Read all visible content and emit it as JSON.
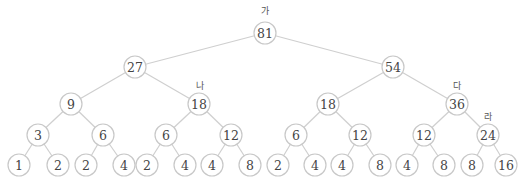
{
  "diagram": {
    "type": "binary-tree",
    "node_radius": 11,
    "colors": {
      "edge": "#cfcfcf",
      "node_stroke": "#c8c8c8",
      "node_fill": "#ffffff",
      "text": "#444444"
    },
    "nodes": [
      {
        "id": "n0",
        "value": "81",
        "x": 265,
        "y": 33
      },
      {
        "id": "n1",
        "value": "27",
        "x": 135,
        "y": 67
      },
      {
        "id": "n2",
        "value": "54",
        "x": 393,
        "y": 67
      },
      {
        "id": "n3",
        "value": "9",
        "x": 71,
        "y": 104
      },
      {
        "id": "n4",
        "value": "18",
        "x": 199,
        "y": 104
      },
      {
        "id": "n5",
        "value": "18",
        "x": 328,
        "y": 104
      },
      {
        "id": "n6",
        "value": "36",
        "x": 457,
        "y": 104
      },
      {
        "id": "n7",
        "value": "3",
        "x": 38,
        "y": 135
      },
      {
        "id": "n8",
        "value": "6",
        "x": 103,
        "y": 135
      },
      {
        "id": "n9",
        "value": "6",
        "x": 166,
        "y": 135
      },
      {
        "id": "n10",
        "value": "12",
        "x": 231,
        "y": 135
      },
      {
        "id": "n11",
        "value": "6",
        "x": 296,
        "y": 135
      },
      {
        "id": "n12",
        "value": "12",
        "x": 360,
        "y": 135
      },
      {
        "id": "n13",
        "value": "12",
        "x": 424,
        "y": 135
      },
      {
        "id": "n14",
        "value": "24",
        "x": 488,
        "y": 135
      },
      {
        "id": "n15",
        "value": "1",
        "x": 19,
        "y": 165
      },
      {
        "id": "n16",
        "value": "2",
        "x": 58,
        "y": 165
      },
      {
        "id": "n17",
        "value": "2",
        "x": 86,
        "y": 165
      },
      {
        "id": "n18",
        "value": "4",
        "x": 124,
        "y": 165
      },
      {
        "id": "n19",
        "value": "2",
        "x": 147,
        "y": 165
      },
      {
        "id": "n20",
        "value": "4",
        "x": 185,
        "y": 165
      },
      {
        "id": "n21",
        "value": "4",
        "x": 212,
        "y": 165
      },
      {
        "id": "n22",
        "value": "8",
        "x": 250,
        "y": 165
      },
      {
        "id": "n23",
        "value": "2",
        "x": 278,
        "y": 165
      },
      {
        "id": "n24",
        "value": "4",
        "x": 315,
        "y": 165
      },
      {
        "id": "n25",
        "value": "4",
        "x": 342,
        "y": 165
      },
      {
        "id": "n26",
        "value": "8",
        "x": 380,
        "y": 165
      },
      {
        "id": "n27",
        "value": "4",
        "x": 407,
        "y": 165
      },
      {
        "id": "n28",
        "value": "8",
        "x": 444,
        "y": 165
      },
      {
        "id": "n29",
        "value": "8",
        "x": 472,
        "y": 165
      },
      {
        "id": "n30",
        "value": "16",
        "x": 506,
        "y": 165
      }
    ],
    "edges": [
      [
        "n0",
        "n1"
      ],
      [
        "n0",
        "n2"
      ],
      [
        "n1",
        "n3"
      ],
      [
        "n1",
        "n4"
      ],
      [
        "n2",
        "n5"
      ],
      [
        "n2",
        "n6"
      ],
      [
        "n3",
        "n7"
      ],
      [
        "n3",
        "n8"
      ],
      [
        "n4",
        "n9"
      ],
      [
        "n4",
        "n10"
      ],
      [
        "n5",
        "n11"
      ],
      [
        "n5",
        "n12"
      ],
      [
        "n6",
        "n13"
      ],
      [
        "n6",
        "n14"
      ],
      [
        "n7",
        "n15"
      ],
      [
        "n7",
        "n16"
      ],
      [
        "n8",
        "n17"
      ],
      [
        "n8",
        "n18"
      ],
      [
        "n9",
        "n19"
      ],
      [
        "n9",
        "n20"
      ],
      [
        "n10",
        "n21"
      ],
      [
        "n10",
        "n22"
      ],
      [
        "n11",
        "n23"
      ],
      [
        "n11",
        "n24"
      ],
      [
        "n12",
        "n25"
      ],
      [
        "n12",
        "n26"
      ],
      [
        "n13",
        "n27"
      ],
      [
        "n13",
        "n28"
      ],
      [
        "n14",
        "n29"
      ],
      [
        "n14",
        "n30"
      ]
    ],
    "tags": [
      {
        "label": "가",
        "node": "n0",
        "x": 265,
        "y": 11
      },
      {
        "label": "나",
        "node": "n4",
        "x": 200,
        "y": 86
      },
      {
        "label": "다",
        "node": "n6",
        "x": 457,
        "y": 86
      },
      {
        "label": "라",
        "node": "n14",
        "x": 488,
        "y": 117
      }
    ]
  }
}
